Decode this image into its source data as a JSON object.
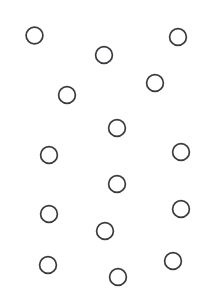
{
  "figure": {
    "canvas": {
      "width": 206,
      "height": 297,
      "background_color": "#ffffff"
    },
    "marker_style": {
      "shape": "circle",
      "fill": "none",
      "stroke_color": "#3b3b3f",
      "stroke_width": 1.7,
      "radius": 8.4
    }
  },
  "chart_data": {
    "type": "scatter",
    "title": "",
    "subtitle": "",
    "xlabel": "",
    "ylabel": "",
    "xlim": [
      0,
      206
    ],
    "ylim": [
      0,
      297
    ],
    "grid": false,
    "legend": null,
    "axes_visible": false,
    "point_count": 15,
    "series": [
      {
        "name": "circles",
        "marker": "open-circle",
        "color": "#3b3b3f",
        "points": [
          {
            "id": "c1",
            "x": 34.5,
            "y": 35.5,
            "r": 8.4
          },
          {
            "id": "c2",
            "x": 178.0,
            "y": 37.0,
            "r": 8.4
          },
          {
            "id": "c3",
            "x": 104.0,
            "y": 55.0,
            "r": 8.4
          },
          {
            "id": "c4",
            "x": 155.0,
            "y": 83.0,
            "r": 8.4
          },
          {
            "id": "c5",
            "x": 67.0,
            "y": 95.0,
            "r": 8.4
          },
          {
            "id": "c6",
            "x": 117.0,
            "y": 128.0,
            "r": 8.4
          },
          {
            "id": "c7",
            "x": 49.0,
            "y": 155.0,
            "r": 8.4
          },
          {
            "id": "c8",
            "x": 181.0,
            "y": 152.0,
            "r": 8.4
          },
          {
            "id": "c9",
            "x": 117.0,
            "y": 184.0,
            "r": 8.4
          },
          {
            "id": "c10",
            "x": 49.0,
            "y": 214.0,
            "r": 8.4
          },
          {
            "id": "c11",
            "x": 181.0,
            "y": 209.0,
            "r": 8.4
          },
          {
            "id": "c12",
            "x": 105.0,
            "y": 231.0,
            "r": 8.4
          },
          {
            "id": "c13",
            "x": 48.0,
            "y": 265.0,
            "r": 8.4
          },
          {
            "id": "c14",
            "x": 173.0,
            "y": 261.0,
            "r": 8.4
          },
          {
            "id": "c15",
            "x": 118.0,
            "y": 277.0,
            "r": 8.4
          }
        ]
      }
    ]
  }
}
